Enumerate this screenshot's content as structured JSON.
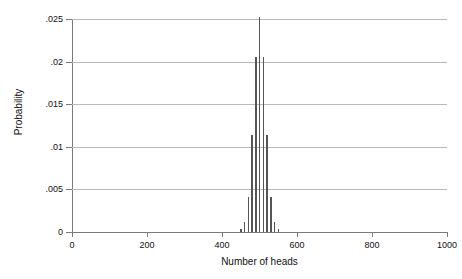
{
  "chart_data": {
    "type": "bar",
    "title": "",
    "subtitle": "",
    "xlabel": "Number of heads",
    "ylabel": "Probability",
    "xlim": [
      0,
      1000
    ],
    "ylim": [
      0,
      0.025
    ],
    "grid": true,
    "legend": null,
    "xticks": [
      0,
      200,
      400,
      600,
      800,
      1000
    ],
    "xtick_labels": [
      "0",
      "200",
      "400",
      "600",
      "800",
      "1000"
    ],
    "yticks": [
      0,
      0.005,
      0.01,
      0.015,
      0.02,
      0.025
    ],
    "ytick_labels": [
      "0",
      ".005",
      ".01",
      ".015",
      ".02",
      ".025"
    ],
    "bar_color": "#555555",
    "grid_color": "#b9b9b9",
    "axis_color": "#7a7a7a",
    "x": [
      450,
      460,
      470,
      480,
      490,
      500,
      510,
      520,
      530,
      540,
      550
    ],
    "values": [
      0.0003,
      0.0012,
      0.0041,
      0.0114,
      0.0206,
      0.0252,
      0.0206,
      0.0114,
      0.0041,
      0.0012,
      0.0003
    ],
    "categories": [
      "450",
      "460",
      "470",
      "480",
      "490",
      "500",
      "510",
      "520",
      "530",
      "540",
      "550"
    ],
    "annotations": []
  }
}
